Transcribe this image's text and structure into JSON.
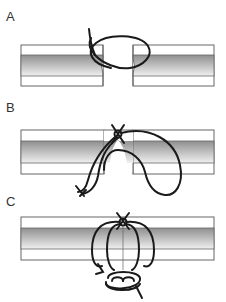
{
  "diagram": {
    "type": "suture technique illustration",
    "panels": [
      {
        "label": "A",
        "description": "Suture loop passed across gap between two tissue edges"
      },
      {
        "label": "B",
        "description": "Suture tied with knot on top, tissue edges partially approximated"
      },
      {
        "label": "C",
        "description": "Suture tightened, tissue edges fully approximated with knot on top"
      }
    ],
    "colors": {
      "tissue_outline": "#666666",
      "tissue_band_dark": "#9a9a9a",
      "tissue_band_light": "#f2f2f2",
      "suture": "#1a1a1a",
      "label": "#333333"
    }
  }
}
